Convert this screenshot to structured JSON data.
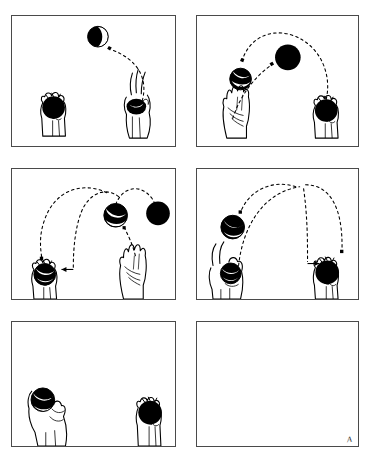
{
  "figure": {
    "background_color": "#ffffff",
    "ink_color": "#000000",
    "border_color": "#4a4a4a",
    "panel_count": 6,
    "columns": 2,
    "rows": 3,
    "signature": "A"
  },
  "ball_styles": {
    "solid": "solid-black-ball",
    "striped": "black-ball-with-white-stripe"
  },
  "panels": [
    {
      "id": "panel-1",
      "index": 1,
      "caption": "First ball thrown from right hand arcing up to the left",
      "hands": [
        {
          "name": "left-hand",
          "pose": "closed-grip-holding-ball",
          "holds_ball": true,
          "ball_style": "solid",
          "x": 52,
          "y": 118
        },
        {
          "name": "right-hand",
          "pose": "releasing-fingers-up",
          "holds_ball": true,
          "ball_style": "solid",
          "x": 140,
          "y": 116
        }
      ],
      "balls": [
        {
          "name": "ball-in-flight-1",
          "style": "striped",
          "x": 98,
          "y": 34,
          "r": 11
        }
      ],
      "trajectories": [
        {
          "name": "arc-right-to-left",
          "from": [
            143,
            100
          ],
          "to": [
            110,
            48
          ],
          "peak": [
            134,
            62
          ],
          "arrow": "end"
        }
      ]
    },
    {
      "id": "panel-2",
      "index": 2,
      "caption": "Second ball thrown from left hand while first ball descends to left",
      "hands": [
        {
          "name": "left-hand",
          "pose": "open-palm-empty",
          "holds_ball": false,
          "x": 237,
          "y": 120
        },
        {
          "name": "right-hand",
          "pose": "closed-grip-holding-ball",
          "holds_ball": true,
          "ball_style": "solid",
          "x": 325,
          "y": 116
        }
      ],
      "balls": [
        {
          "name": "ball-in-flight-1",
          "style": "striped",
          "x": 238,
          "y": 65,
          "r": 11
        },
        {
          "name": "ball-in-flight-2",
          "style": "solid",
          "x": 290,
          "y": 50,
          "r": 13
        }
      ],
      "trajectories": [
        {
          "name": "arc-first-ball-descending",
          "from": [
            300,
            32
          ],
          "to": [
            248,
            57
          ],
          "peak": [
            268,
            36
          ],
          "arrow": "end"
        },
        {
          "name": "arc-second-ball-rising",
          "from": [
            228,
            108
          ],
          "to": [
            277,
            60
          ],
          "peak": [
            244,
            76
          ],
          "arrow": "end"
        },
        {
          "name": "arc-third-ball-rising-right",
          "from": [
            330,
            100
          ],
          "to": [
            305,
            31
          ],
          "peak": [
            333,
            50
          ],
          "arrow": "none"
        }
      ]
    },
    {
      "id": "panel-3",
      "index": 3,
      "caption": "First ball caught in left hand as second and third balls travel",
      "hands": [
        {
          "name": "left-hand",
          "pose": "catching-grip-holding-ball",
          "holds_ball": true,
          "ball_style": "striped",
          "x": 42,
          "y": 272
        },
        {
          "name": "right-hand",
          "pose": "open-palm-empty",
          "holds_ball": false,
          "x": 133,
          "y": 275
        }
      ],
      "balls": [
        {
          "name": "ball-in-flight-2",
          "style": "striped",
          "x": 115,
          "y": 215,
          "r": 12
        },
        {
          "name": "ball-in-flight-3",
          "style": "solid",
          "x": 156,
          "y": 213,
          "r": 12
        }
      ],
      "trajectories": [
        {
          "name": "arc-descending-to-left-hand",
          "from": [
            105,
            190
          ],
          "to": [
            46,
            260
          ],
          "peak": [
            62,
            198
          ],
          "arrow": "end"
        },
        {
          "name": "arc-into-left-hand-horizontal",
          "from": [
            122,
            188
          ],
          "to": [
            65,
            268
          ],
          "peak": [
            96,
            200
          ],
          "arrow": "end"
        },
        {
          "name": "arc-third-ball-rising-right",
          "from": [
            122,
            212
          ],
          "to": [
            158,
            196
          ],
          "peak": [
            140,
            190
          ],
          "arrow": "end"
        }
      ]
    },
    {
      "id": "panel-4",
      "index": 4,
      "caption": "Third ball caught in right hand while next ball descends left",
      "hands": [
        {
          "name": "left-hand",
          "pose": "holding-ball-fingers-raised",
          "holds_ball": true,
          "ball_style": "striped",
          "x": 224,
          "y": 270
        },
        {
          "name": "right-hand",
          "pose": "closed-grip-holding-ball",
          "holds_ball": true,
          "ball_style": "solid",
          "x": 333,
          "y": 272
        }
      ],
      "balls": [
        {
          "name": "ball-in-flight-2",
          "style": "striped",
          "x": 231,
          "y": 227,
          "r": 12
        }
      ],
      "trajectories": [
        {
          "name": "arc-descending-to-left",
          "from": [
            290,
            180
          ],
          "to": [
            239,
            213
          ],
          "peak": [
            255,
            184
          ],
          "arrow": "end"
        },
        {
          "name": "arc-rising-from-left",
          "from": [
            247,
            255
          ],
          "to": [
            299,
            180
          ],
          "peak": [
            258,
            196
          ],
          "arrow": "end"
        },
        {
          "name": "arc-descending-to-right-hand",
          "from": [
            300,
            182
          ],
          "to": [
            338,
            250
          ],
          "peak": [
            330,
            192
          ],
          "arrow": "end"
        }
      ]
    },
    {
      "id": "panel-5",
      "index": 5,
      "caption": "Both balls held, cascade pattern complete",
      "hands": [
        {
          "name": "left-hand",
          "pose": "holding-ball-angled",
          "holds_ball": true,
          "ball_style": "striped",
          "x": 48,
          "y": 408
        },
        {
          "name": "right-hand",
          "pose": "closed-grip-holding-ball",
          "holds_ball": true,
          "ball_style": "solid",
          "x": 152,
          "y": 410
        }
      ],
      "balls": [],
      "trajectories": []
    },
    {
      "id": "panel-6",
      "index": 6,
      "caption": "Empty frame with artist signature",
      "hands": [],
      "balls": [],
      "trajectories": [],
      "signature": "A"
    }
  ]
}
